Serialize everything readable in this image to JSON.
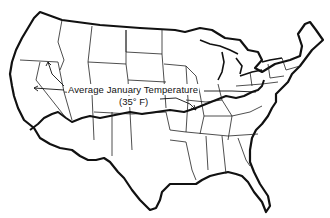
{
  "map": {
    "subject": "Contiguous United States",
    "style": "black-and-white outline map with state boundaries",
    "annotation": {
      "title": "Average January Temperature",
      "value": "(35° F)",
      "feature": "isotherm line crossing the country from west coast to mid-Atlantic coast"
    },
    "colors": {
      "background": "#ffffff",
      "outline": "#111111",
      "state_borders": "#222222"
    }
  }
}
